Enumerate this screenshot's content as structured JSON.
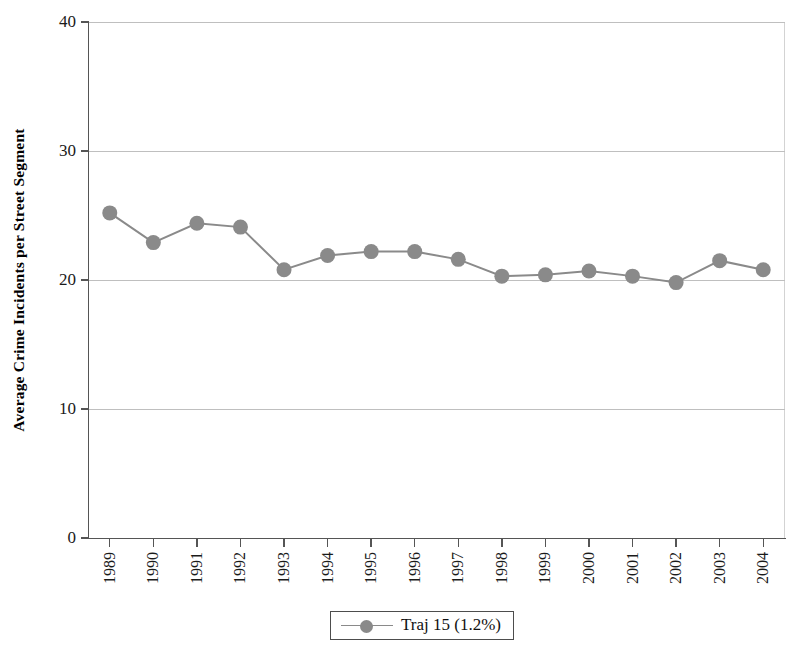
{
  "chart_data": {
    "type": "line",
    "title": "",
    "xlabel": "",
    "ylabel": "Average Crime Incidents per Street Segment",
    "categories": [
      "1989",
      "1990",
      "1991",
      "1992",
      "1993",
      "1994",
      "1995",
      "1996",
      "1997",
      "1998",
      "1999",
      "2000",
      "2001",
      "2002",
      "2003",
      "2004"
    ],
    "series": [
      {
        "name": "Traj 15 (1.2%)",
        "values": [
          25.2,
          22.9,
          24.4,
          24.1,
          20.8,
          21.9,
          22.2,
          22.2,
          21.6,
          20.3,
          20.4,
          20.7,
          20.3,
          19.8,
          21.5,
          20.8
        ],
        "color": "#8a8a8a",
        "marker": "circle"
      }
    ],
    "ylim": [
      0,
      40
    ],
    "yticks": [
      0,
      10,
      20,
      30,
      40
    ],
    "ytick_labels": [
      "0",
      "10",
      "20",
      "30",
      "40"
    ],
    "grid": "horizontal",
    "legend_position": "bottom",
    "legend_entries": [
      "Traj 15 (1.2%)"
    ]
  },
  "axes": {
    "y_title": "Average Crime Incidents per Street Segment",
    "y_tick_labels": [
      "40",
      "30",
      "20",
      "10",
      "0"
    ],
    "x_tick_labels": [
      "1989",
      "1990",
      "1991",
      "1992",
      "1993",
      "1994",
      "1995",
      "1996",
      "1997",
      "1998",
      "1999",
      "2000",
      "2001",
      "2002",
      "2003",
      "2004"
    ]
  },
  "legend": {
    "label": "Traj 15 (1.2%)"
  },
  "colors": {
    "series": "#8a8a8a",
    "gridline": "#bfbfbf",
    "axis": "#555555",
    "text": "#1a1a1a",
    "background": "#ffffff"
  }
}
